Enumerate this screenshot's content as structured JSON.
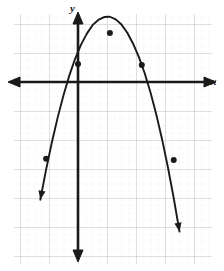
{
  "figure": {
    "name": "parabola-graph",
    "background_color": "#ffffff",
    "ink_color": "#1a1a1a"
  },
  "axes": {
    "x_label": "x",
    "y_label": "y",
    "x_axis_pixel_y": 82,
    "y_axis_pixel_x": 78,
    "arrows": [
      "left",
      "right",
      "up",
      "down"
    ]
  },
  "grid": {
    "major_color": "#c9c9c9",
    "minor_color": "#d8d8d8",
    "major_spacing_px": 29,
    "minor_per_major": 4,
    "major_x_px": [
      20,
      49,
      78,
      107,
      136,
      165,
      194
    ],
    "major_y_px": [
      24,
      53,
      82,
      111,
      140,
      169,
      198,
      227,
      256
    ],
    "visible": true
  },
  "chart_data": {
    "type": "line",
    "title": "",
    "xlabel": "x",
    "ylabel": "y",
    "grid": true,
    "legend": null,
    "xlim": [
      -2.0,
      4.0
    ],
    "ylim": [
      -6.5,
      2.0
    ],
    "curve": {
      "name": "parabola",
      "shape": "downward-opening parabola",
      "vertex": [
        1.1,
        1.7
      ],
      "opens": "down",
      "x": [
        -1.3,
        -1.1,
        -0.9,
        -0.7,
        -0.5,
        -0.3,
        -0.1,
        0.1,
        0.3,
        0.5,
        0.7,
        0.9,
        1.1,
        1.3,
        1.5,
        1.7,
        1.9,
        2.1,
        2.3,
        2.5,
        2.7,
        2.9,
        3.1,
        3.3,
        3.5
      ],
      "y": [
        -4.06,
        -3.02,
        -2.08,
        -1.22,
        -0.46,
        0.22,
        0.8,
        1.28,
        1.66,
        1.96,
        2.14,
        2.24,
        2.25,
        2.16,
        1.98,
        1.7,
        1.32,
        0.86,
        0.3,
        -0.36,
        -1.12,
        -1.98,
        -2.94,
        -4.0,
        -5.16
      ]
    },
    "points": [
      {
        "label": "left-lower-point",
        "x": -1.1,
        "y": -2.65,
        "pixel": [
          46,
          159
        ]
      },
      {
        "label": "y-intercept-point",
        "x": 0.0,
        "y": 0.62,
        "pixel": [
          78,
          64
        ]
      },
      {
        "label": "vertex-point",
        "x": 1.1,
        "y": 1.69,
        "pixel": [
          110,
          33
        ]
      },
      {
        "label": "right-upper-point",
        "x": 2.2,
        "y": 0.59,
        "pixel": [
          142,
          65
        ]
      },
      {
        "label": "right-lower-point",
        "x": 3.3,
        "y": -2.69,
        "pixel": [
          174,
          160
        ]
      }
    ],
    "point_style": {
      "marker": "filled-circle",
      "color": "#1a1a1a",
      "radius_px": 3
    }
  }
}
